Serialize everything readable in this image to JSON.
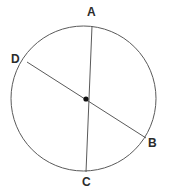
{
  "figure": {
    "kind": "circle-with-diameters",
    "background_color": "#ffffff",
    "stroke_color": "#5a5a5a",
    "center_dot_color": "#111111",
    "label_color": "#2b2b2b",
    "circle": {
      "name": "circle-outline",
      "cx": 83.5,
      "cy": 98.5,
      "r": 72.5,
      "stroke_width": 1
    },
    "center_point": {
      "name": "center-point",
      "cx": 86,
      "cy": 99,
      "r": 2.6
    },
    "chords": [
      {
        "name": "chord-AC",
        "from_label": "A",
        "to_label": "C",
        "x1": 92,
        "y1": 26,
        "x2": 86,
        "y2": 172,
        "stroke_width": 1
      },
      {
        "name": "chord-DB",
        "from_label": "D",
        "to_label": "B",
        "x1": 27,
        "y1": 62,
        "x2": 146,
        "y2": 138,
        "stroke_width": 1
      }
    ],
    "labels": [
      {
        "id": "A",
        "text": "A",
        "x": 87,
        "y": 6
      },
      {
        "id": "B",
        "text": "B",
        "x": 148,
        "y": 137
      },
      {
        "id": "C",
        "text": "C",
        "x": 82,
        "y": 176
      },
      {
        "id": "D",
        "text": "D",
        "x": 11,
        "y": 53
      }
    ]
  }
}
